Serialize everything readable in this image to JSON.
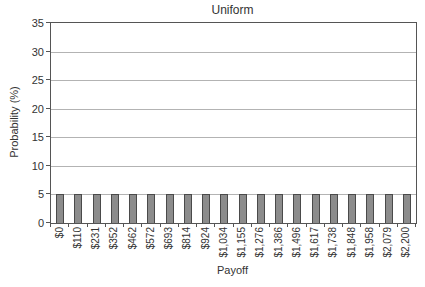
{
  "chart_data": {
    "type": "bar",
    "title": "Uniform",
    "xlabel": "Payoff",
    "ylabel": "Probability (%)",
    "categories": [
      "$0",
      "$110",
      "$231",
      "$352",
      "$462",
      "$572",
      "$693",
      "$814",
      "$924",
      "$1,034",
      "$1,155",
      "$1,276",
      "$1,386",
      "$1,496",
      "$1,617",
      "$1,738",
      "$1,848",
      "$1,958",
      "$2,079",
      "$2,200"
    ],
    "values": [
      5,
      5,
      5,
      5,
      5,
      5,
      5,
      5,
      5,
      5,
      5,
      5,
      5,
      5,
      5,
      5,
      5,
      5,
      5,
      5
    ],
    "ylim": [
      0,
      35
    ],
    "yticks": [
      0,
      5,
      10,
      15,
      20,
      25,
      30,
      35
    ],
    "grid": "horizontal",
    "legend": "none",
    "colors": {
      "bar_fill": "#8c8c8c",
      "bar_border": "#4a4a4a",
      "gridline": "#b3b3b3",
      "axis": "#555555",
      "text": "#333333",
      "background": "#ffffff"
    }
  }
}
